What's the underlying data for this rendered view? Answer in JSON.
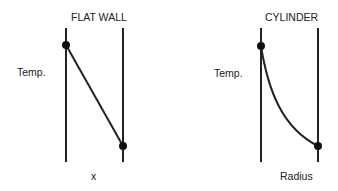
{
  "panels": [
    {
      "title": "FLAT WALL",
      "ylabel": "Temp.",
      "xlabel": "x",
      "profile": "linear"
    },
    {
      "title": "CYLINDER",
      "ylabel": "Temp.",
      "xlabel": "Radius",
      "profile": "logarithmic curve"
    }
  ],
  "colors": {
    "line": "#222222",
    "background": "#ffffff"
  }
}
